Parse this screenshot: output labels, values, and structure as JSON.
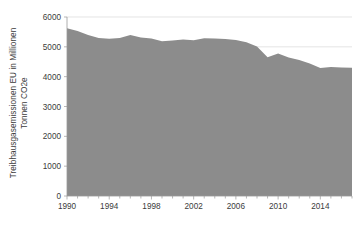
{
  "chart_data": {
    "type": "area",
    "title": "",
    "xlabel": "",
    "ylabel": "Treibhausgasemissionen EU in Millionen Tonnen CO2e",
    "ylabel_line1": "Treibhausgasemissionen EU in Millionen",
    "ylabel_line2": "Tonnen CO2e",
    "ylim": [
      0,
      6000
    ],
    "xlim": [
      1990,
      2017
    ],
    "grid": true,
    "grid_axis": "y",
    "legend": false,
    "series_color": "#8c8c8c",
    "x": [
      1990,
      1991,
      1992,
      1993,
      1994,
      1995,
      1996,
      1997,
      1998,
      1999,
      2000,
      2001,
      2002,
      2003,
      2004,
      2005,
      2006,
      2007,
      2008,
      2009,
      2010,
      2011,
      2012,
      2013,
      2014,
      2015,
      2016,
      2017
    ],
    "values": [
      5620,
      5530,
      5400,
      5300,
      5270,
      5300,
      5400,
      5310,
      5280,
      5190,
      5210,
      5250,
      5220,
      5290,
      5280,
      5260,
      5230,
      5150,
      5010,
      4650,
      4780,
      4640,
      4560,
      4440,
      4290,
      4320,
      4310,
      4300
    ],
    "ytick_labels": [
      "0",
      "1000",
      "2000",
      "3000",
      "4000",
      "5000",
      "6000"
    ],
    "ytick_values": [
      0,
      1000,
      2000,
      3000,
      4000,
      5000,
      6000
    ],
    "xtick_labels": [
      "1990",
      "1994",
      "1998",
      "2002",
      "2006",
      "2010",
      "2014"
    ],
    "xtick_values": [
      1990,
      1994,
      1998,
      2002,
      2006,
      2010,
      2014
    ]
  }
}
